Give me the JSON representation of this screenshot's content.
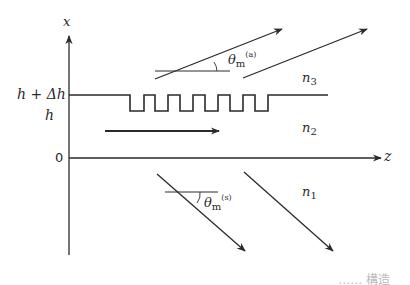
{
  "diagram": {
    "type": "grating-coupler waveguide schematic",
    "axes": {
      "vertical_label": "x",
      "horizontal_label": "z",
      "origin_label": "0"
    },
    "levels": {
      "top_label": "h + Δh",
      "bottom_label": "h"
    },
    "regions": {
      "cover": {
        "name": "n",
        "index": "3"
      },
      "film": {
        "name": "n",
        "index": "2"
      },
      "substrate": {
        "name": "n",
        "index": "1"
      }
    },
    "angles": {
      "air": {
        "symbol": "θ",
        "sub": "m",
        "sup": "(a)"
      },
      "substrate": {
        "symbol": "θ",
        "sub": "m",
        "sup": "(s)"
      }
    },
    "grating_teeth": 6,
    "caption_fragment": "…… 構造"
  },
  "colors": {
    "line": "#2a2a2a",
    "background": "#ffffff"
  }
}
